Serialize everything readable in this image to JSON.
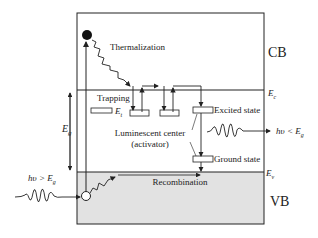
{
  "labels": {
    "cb": "CB",
    "vb": "VB",
    "ec": "E",
    "ec_sub": "c",
    "ev": "E",
    "ev_sub": "v",
    "eg": "E",
    "eg_sub": "g",
    "et": "E",
    "et_sub": "t",
    "thermalization": "Thermalization",
    "trapping": "Trapping",
    "excited_state": "Excited state",
    "ground_state": "Ground state",
    "luminescent_center": "Luminescent center",
    "activator": "(activator)",
    "recombination": "Recombination",
    "absorbed_photon": "hυ > E",
    "absorbed_photon_sub": "g",
    "emitted_photon": "hυ < E",
    "emitted_photon_sub": "g"
  },
  "colors": {
    "line": "#222222",
    "valence_fill": "#e2e2e2",
    "background": "#ffffff"
  }
}
